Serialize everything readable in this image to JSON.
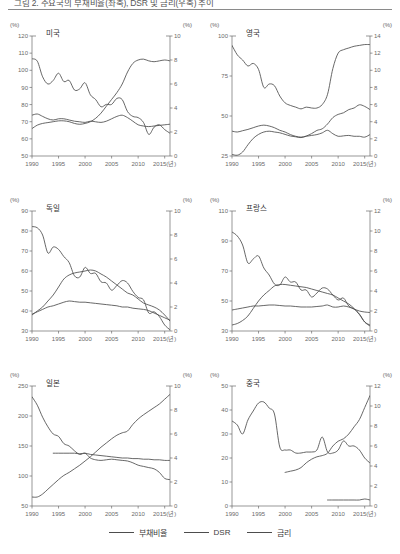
{
  "figure": {
    "title": "그림 2. 주요국의 부채비율(좌축), DSR 및 금리(우축) 추이",
    "unit_label": "(%)",
    "x_axis_last_suffix": "2015(년)"
  },
  "legend": {
    "position": "bottom-center",
    "items": [
      {
        "label": "부채비율",
        "color": "#4d4d4d",
        "name": "debt-ratio"
      },
      {
        "label": "DSR",
        "color": "#4d4d4d",
        "name": "dsr"
      },
      {
        "label": "금리",
        "color": "#4d4d4d",
        "name": "interest-rate"
      }
    ]
  },
  "axis": {
    "x_ticks": [
      "1990",
      "1995",
      "2000",
      "2005",
      "2010",
      "2015(년)"
    ],
    "x_tick_values": [
      1990,
      1995,
      2000,
      2005,
      2010,
      2015
    ],
    "xlim": [
      1990,
      2016
    ]
  },
  "chart_data": [
    {
      "type": "line",
      "title": "미국",
      "unit_left": "(%)",
      "unit_right": "(%)",
      "xlabel": "",
      "ylabel": "",
      "grid": false,
      "ylim": [
        50,
        120
      ],
      "y_ticks": [
        50,
        60,
        70,
        80,
        90,
        100,
        110,
        120
      ],
      "ylim_right": [
        0,
        10
      ],
      "y_ticks_right": [
        0,
        2,
        4,
        6,
        8,
        10
      ],
      "x": [
        1990,
        1991,
        1992,
        1993,
        1994,
        1995,
        1996,
        1997,
        1998,
        1999,
        2000,
        2001,
        2002,
        2003,
        2004,
        2005,
        2006,
        2007,
        2008,
        2009,
        2010,
        2011,
        2012,
        2013,
        2014,
        2015,
        2016
      ],
      "series": [
        {
          "name": "부채비율",
          "axis": "left",
          "color": "#4d4d4d",
          "values": [
            66,
            68,
            69,
            69.5,
            70,
            70.5,
            70.5,
            70,
            69,
            68.5,
            69,
            70,
            72,
            75,
            79,
            83,
            87,
            92,
            99,
            104,
            106,
            106.5,
            105.5,
            105,
            105.5,
            106,
            105.5
          ]
        },
        {
          "name": "DSR",
          "axis": "right",
          "color": "#4d4d4d",
          "values": [
            3.4,
            3.5,
            3.3,
            3.1,
            3.0,
            3.1,
            3.1,
            3.0,
            2.9,
            2.85,
            2.8,
            2.9,
            2.85,
            2.8,
            2.9,
            3.1,
            3.3,
            3.4,
            3.2,
            2.9,
            2.6,
            2.5,
            2.45,
            2.5,
            2.55,
            2.6,
            2.65
          ]
        },
        {
          "name": "금리",
          "axis": "right",
          "color": "#4d4d4d",
          "values": [
            8.1,
            7.9,
            6.6,
            6.0,
            6.3,
            6.9,
            6.2,
            6.3,
            5.5,
            5.6,
            6.1,
            5.1,
            4.7,
            4.1,
            4.3,
            4.3,
            4.8,
            4.7,
            3.7,
            3.3,
            3.2,
            2.8,
            1.8,
            2.4,
            2.6,
            2.2,
            1.9
          ]
        }
      ]
    },
    {
      "type": "line",
      "title": "영국",
      "unit_left": "(%)",
      "unit_right": "(%)",
      "grid": false,
      "ylim": [
        25,
        100
      ],
      "y_ticks": [
        25,
        50,
        75,
        100
      ],
      "ylim_right": [
        0,
        14
      ],
      "y_ticks_right": [
        0,
        2,
        4,
        6,
        8,
        10,
        12,
        14
      ],
      "x": [
        1990,
        1991,
        1992,
        1993,
        1994,
        1995,
        1996,
        1997,
        1998,
        1999,
        2000,
        2001,
        2002,
        2003,
        2004,
        2005,
        2006,
        2007,
        2008,
        2009,
        2010,
        2011,
        2012,
        2013,
        2014,
        2015,
        2016
      ],
      "series": [
        {
          "name": "부채비율",
          "axis": "left",
          "color": "#4d4d4d",
          "values": [
            26,
            25.5,
            27.5,
            32,
            36,
            38.5,
            40,
            40.5,
            40,
            39.5,
            38.5,
            37.5,
            37,
            36.5,
            37.5,
            39,
            41,
            42,
            45,
            49,
            51,
            52,
            54,
            55,
            57,
            56,
            54
          ]
        },
        {
          "name": "DSR",
          "axis": "right",
          "color": "#4d4d4d",
          "values": [
            2.9,
            2.8,
            2.95,
            3.1,
            3.3,
            3.5,
            3.6,
            3.5,
            3.3,
            3.0,
            2.8,
            2.5,
            2.3,
            2.2,
            2.3,
            2.4,
            2.5,
            2.7,
            3.0,
            2.6,
            2.3,
            2.35,
            2.4,
            2.3,
            2.3,
            2.2,
            2.5
          ]
        },
        {
          "name": "금리",
          "axis": "right",
          "color": "#4d4d4d",
          "values": [
            12.9,
            11.8,
            11.2,
            10.5,
            10.8,
            10.1,
            8.0,
            8.4,
            8.2,
            7.0,
            6.2,
            5.9,
            5.7,
            5.5,
            5.7,
            5.6,
            5.6,
            6.0,
            7.2,
            10.2,
            12.0,
            12.4,
            12.6,
            12.8,
            12.9,
            13.0,
            13.0
          ]
        }
      ]
    },
    {
      "type": "line",
      "title": "독일",
      "unit_left": "(%)",
      "unit_right": "(%)",
      "grid": false,
      "ylim": [
        30,
        90
      ],
      "y_ticks": [
        30,
        40,
        50,
        60,
        70,
        80,
        90
      ],
      "ylim_right": [
        0,
        10
      ],
      "y_ticks_right": [
        0,
        2,
        4,
        6,
        8,
        10
      ],
      "x": [
        1990,
        1991,
        1992,
        1993,
        1994,
        1995,
        1996,
        1997,
        1998,
        1999,
        2000,
        2001,
        2002,
        2003,
        2004,
        2005,
        2006,
        2007,
        2008,
        2009,
        2010,
        2011,
        2012,
        2013,
        2014,
        2015,
        2016
      ],
      "series": [
        {
          "name": "부채비율",
          "axis": "left",
          "color": "#4d4d4d",
          "values": [
            38,
            40,
            42,
            45,
            48,
            52,
            56,
            58,
            59,
            59.5,
            60,
            60.5,
            60,
            58.5,
            57,
            55,
            53,
            51,
            49,
            48,
            46,
            44,
            43,
            42,
            40.5,
            38,
            35
          ]
        },
        {
          "name": "DSR",
          "axis": "right",
          "color": "#4d4d4d",
          "values": [
            1.4,
            1.6,
            1.8,
            2.0,
            2.1,
            2.25,
            2.4,
            2.5,
            2.45,
            2.4,
            2.4,
            2.35,
            2.3,
            2.25,
            2.2,
            2.15,
            2.1,
            2.0,
            2.0,
            1.9,
            1.85,
            1.8,
            1.7,
            1.5,
            1.3,
            1.1,
            0.9
          ]
        },
        {
          "name": "금리",
          "axis": "right",
          "color": "#4d4d4d",
          "values": [
            8.7,
            8.6,
            8.0,
            6.5,
            7.0,
            6.8,
            6.2,
            5.7,
            4.6,
            4.5,
            5.3,
            4.8,
            4.8,
            4.1,
            4.0,
            3.4,
            3.8,
            4.2,
            4.0,
            3.3,
            2.8,
            2.6,
            1.5,
            1.6,
            1.2,
            0.5,
            0.1
          ]
        }
      ]
    },
    {
      "type": "line",
      "title": "프랑스",
      "unit_left": "(%)",
      "unit_right": "(%)",
      "grid": false,
      "ylim": [
        30,
        110
      ],
      "y_ticks": [
        30,
        50,
        70,
        90,
        110
      ],
      "ylim_right": [
        0,
        12
      ],
      "y_ticks_right": [
        0,
        2,
        4,
        6,
        8,
        10,
        12
      ],
      "x": [
        1990,
        1991,
        1992,
        1993,
        1994,
        1995,
        1996,
        1997,
        1998,
        1999,
        2000,
        2001,
        2002,
        2003,
        2004,
        2005,
        2006,
        2007,
        2008,
        2009,
        2010,
        2011,
        2012,
        2013,
        2014,
        2015,
        2016
      ],
      "series": [
        {
          "name": "부채비율",
          "axis": "left",
          "color": "#4d4d4d",
          "values": [
            34,
            35,
            37,
            40,
            45,
            50,
            54,
            57,
            60,
            61,
            61,
            60.5,
            60,
            59.5,
            59,
            58,
            57,
            56,
            55,
            54,
            52,
            50,
            48,
            45,
            41,
            36,
            34
          ]
        },
        {
          "name": "DSR",
          "axis": "right",
          "color": "#4d4d4d",
          "values": [
            2.1,
            2.2,
            2.3,
            2.4,
            2.5,
            2.5,
            2.55,
            2.6,
            2.6,
            2.55,
            2.5,
            2.5,
            2.45,
            2.4,
            2.4,
            2.4,
            2.45,
            2.5,
            2.6,
            2.4,
            2.4,
            2.5,
            2.4,
            2.2,
            2.0,
            1.9,
            1.85
          ]
        },
        {
          "name": "금리",
          "axis": "right",
          "color": "#4d4d4d",
          "values": [
            9.9,
            9.5,
            8.6,
            6.8,
            7.2,
            7.5,
            6.3,
            5.6,
            4.7,
            4.6,
            5.4,
            4.9,
            4.9,
            4.1,
            4.1,
            3.4,
            3.8,
            4.3,
            4.2,
            3.6,
            3.1,
            3.3,
            2.5,
            2.2,
            1.7,
            0.9,
            0.5
          ]
        }
      ]
    },
    {
      "type": "line",
      "title": "일본",
      "unit_left": "(%)",
      "unit_right": "(%)",
      "grid": false,
      "ylim": [
        50,
        250
      ],
      "y_ticks": [
        50,
        100,
        150,
        200,
        250
      ],
      "ylim_right": [
        0,
        10
      ],
      "y_ticks_right": [
        0,
        2,
        4,
        6,
        8,
        10
      ],
      "x": [
        1990,
        1991,
        1992,
        1993,
        1994,
        1995,
        1996,
        1997,
        1998,
        1999,
        2000,
        2001,
        2002,
        2003,
        2004,
        2005,
        2006,
        2007,
        2008,
        2009,
        2010,
        2011,
        2012,
        2013,
        2014,
        2015,
        2016
      ],
      "series": [
        {
          "name": "부채비율",
          "axis": "left",
          "color": "#4d4d4d",
          "values": [
            65,
            65,
            70,
            78,
            86,
            94,
            101,
            106,
            112,
            118,
            125,
            132,
            140,
            148,
            155,
            162,
            168,
            172,
            175,
            186,
            195,
            202,
            208,
            214,
            220,
            228,
            236
          ]
        },
        {
          "name": "DSR",
          "axis": "right",
          "color": "#4d4d4d",
          "values": [
            null,
            null,
            null,
            null,
            4.4,
            4.4,
            4.4,
            4.4,
            4.4,
            4.35,
            4.4,
            4.3,
            4.25,
            4.2,
            4.15,
            4.1,
            4.05,
            4.0,
            4.0,
            3.95,
            3.95,
            3.9,
            3.9,
            3.85,
            3.85,
            3.8,
            3.8
          ]
        },
        {
          "name": "금리",
          "axis": "right",
          "color": "#4d4d4d",
          "values": [
            9.1,
            8.4,
            7.4,
            6.6,
            6.0,
            5.8,
            5.2,
            5.0,
            4.6,
            4.3,
            4.4,
            4.0,
            3.85,
            3.8,
            3.85,
            3.9,
            3.85,
            3.8,
            3.75,
            3.6,
            3.4,
            3.3,
            3.2,
            3.1,
            2.8,
            2.3,
            2.2
          ]
        }
      ]
    },
    {
      "type": "line",
      "title": "중국",
      "unit_left": "(%)",
      "unit_right": "(%)",
      "grid": false,
      "ylim": [
        0,
        50
      ],
      "y_ticks": [
        0,
        10,
        20,
        30,
        40,
        50
      ],
      "ylim_right": [
        0,
        12
      ],
      "y_ticks_right": [
        0,
        2,
        4,
        6,
        8,
        10,
        12
      ],
      "x": [
        1990,
        1991,
        1992,
        1993,
        1994,
        1995,
        1996,
        1997,
        1998,
        1999,
        2000,
        2001,
        2002,
        2003,
        2004,
        2005,
        2006,
        2007,
        2008,
        2009,
        2010,
        2011,
        2012,
        2013,
        2014,
        2015,
        2016
      ],
      "series": [
        {
          "name": "부채비율",
          "axis": "left",
          "color": "#4d4d4d",
          "values": [
            null,
            null,
            null,
            null,
            null,
            null,
            null,
            null,
            null,
            null,
            14,
            14.5,
            15,
            16,
            18,
            19.5,
            20.5,
            21,
            22,
            25,
            27,
            28,
            30,
            33,
            36,
            41,
            46
          ]
        },
        {
          "name": "DSR",
          "axis": "right",
          "color": "#4d4d4d",
          "values": [
            null,
            null,
            null,
            null,
            null,
            null,
            null,
            null,
            null,
            null,
            null,
            null,
            null,
            null,
            null,
            null,
            null,
            null,
            0.6,
            0.6,
            0.6,
            0.6,
            0.6,
            0.6,
            0.6,
            0.7,
            0.6
          ]
        },
        {
          "name": "금리",
          "axis": "right",
          "color": "#4d4d4d",
          "values": [
            8.5,
            8.1,
            7.2,
            8.6,
            9.5,
            10.3,
            10.4,
            9.8,
            9.2,
            5.9,
            5.6,
            5.6,
            5.3,
            5.3,
            5.4,
            5.4,
            5.6,
            6.9,
            5.4,
            5.3,
            5.6,
            6.5,
            6.0,
            6.0,
            5.6,
            4.8,
            4.3
          ]
        }
      ]
    }
  ]
}
